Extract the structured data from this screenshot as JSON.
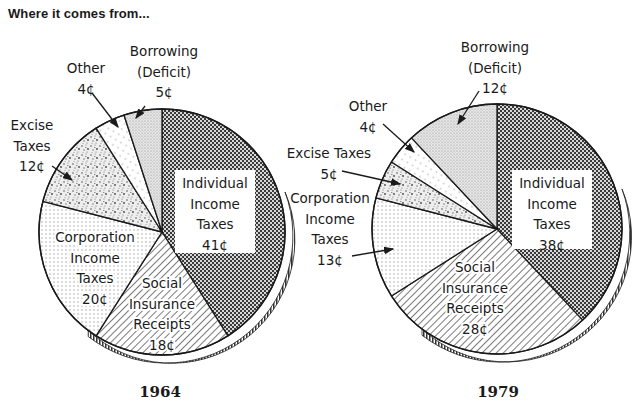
{
  "title": "Where it comes from...",
  "chart_data": [
    {
      "type": "pie",
      "title": "1964",
      "unit": "cents per dollar",
      "start_angle_deg": 0,
      "direction": "clockwise",
      "center": [
        162,
        232
      ],
      "radius": 123,
      "slices": [
        {
          "label": "Individual Income Taxes",
          "value": 41,
          "display": "41¢",
          "pattern": "pat-dark"
        },
        {
          "label": "Social Insurance Receipts",
          "value": 18,
          "display": "18¢",
          "pattern": "pat-hatch"
        },
        {
          "label": "Corporation Income Taxes",
          "value": 20,
          "display": "20¢",
          "pattern": "pat-dots"
        },
        {
          "label": "Excise Taxes",
          "value": 12,
          "display": "12¢",
          "pattern": "pat-speckle"
        },
        {
          "label": "Other",
          "value": 4,
          "display": "4¢",
          "pattern": "pat-dash"
        },
        {
          "label": "Borrowing (Deficit)",
          "value": 5,
          "display": "5¢",
          "pattern": "pat-stipple"
        }
      ],
      "labels": [
        {
          "lines": [
            "Individual",
            "Income",
            "Taxes",
            "41¢"
          ],
          "x": 215,
          "y": 188,
          "box": [
            175,
            170,
            80,
            83
          ]
        },
        {
          "lines": [
            "Social",
            "Insurance",
            "Receipts",
            "18¢"
          ],
          "x": 162,
          "y": 288
        },
        {
          "lines": [
            "Corporation",
            "Income",
            "Taxes",
            "20¢"
          ],
          "x": 95,
          "y": 242
        },
        {
          "lines": [
            "Excise",
            "Taxes",
            "12¢"
          ],
          "x": 32,
          "y": 130,
          "arrow": [
            52,
            166,
            72,
            180
          ]
        },
        {
          "lines": [
            "Other",
            "4¢"
          ],
          "x": 86,
          "y": 73,
          "arrow": [
            92,
            93,
            118,
            127
          ]
        },
        {
          "lines": [
            "Borrowing",
            "(Deficit)",
            "5¢"
          ],
          "x": 164,
          "y": 56,
          "arrow": [
            145,
            106,
            136,
            118
          ]
        }
      ]
    },
    {
      "type": "pie",
      "title": "1979",
      "unit": "cents per dollar",
      "start_angle_deg": 0,
      "direction": "clockwise",
      "center": [
        497,
        229
      ],
      "radius": 125,
      "slices": [
        {
          "label": "Individual Income Taxes",
          "value": 38,
          "display": "38¢",
          "pattern": "pat-dark"
        },
        {
          "label": "Social Insurance Receipts",
          "value": 28,
          "display": "28¢",
          "pattern": "pat-hatch"
        },
        {
          "label": "Corporation Income Taxes",
          "value": 13,
          "display": "13¢",
          "pattern": "pat-dots"
        },
        {
          "label": "Excise Taxes",
          "value": 5,
          "display": "5¢",
          "pattern": "pat-speckle"
        },
        {
          "label": "Other",
          "value": 4,
          "display": "4¢",
          "pattern": "pat-dash"
        },
        {
          "label": "Borrowing (Deficit)",
          "value": 12,
          "display": "12¢",
          "pattern": "pat-stipple"
        }
      ],
      "labels": [
        {
          "lines": [
            "Individual",
            "Income",
            "Taxes",
            "38¢"
          ],
          "x": 552,
          "y": 188,
          "box": [
            512,
            170,
            80,
            79
          ]
        },
        {
          "lines": [
            "Social",
            "Insurance",
            "Receipts",
            "28¢"
          ],
          "x": 475,
          "y": 272
        },
        {
          "lines": [
            "Corporation",
            "Income",
            "Taxes",
            "13¢"
          ],
          "x": 330,
          "y": 203,
          "arrow": [
            352,
            256,
            393,
            249
          ]
        },
        {
          "lines": [
            "Excise Taxes",
            "5¢"
          ],
          "x": 329,
          "y": 158,
          "arrow": [
            342,
            171,
            400,
            184
          ]
        },
        {
          "lines": [
            "Other",
            "4¢"
          ],
          "x": 368,
          "y": 111,
          "arrow": [
            383,
            124,
            414,
            152
          ]
        },
        {
          "lines": [
            "Borrowing",
            "(Deficit)",
            "12¢"
          ],
          "x": 495,
          "y": 52,
          "arrow": [
            479,
            91,
            458,
            124
          ]
        }
      ]
    }
  ]
}
